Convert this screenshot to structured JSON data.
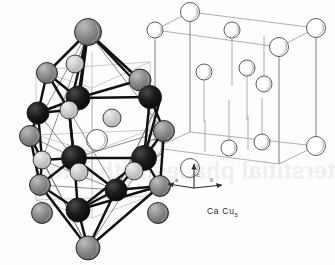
{
  "figure": {
    "name": "CaCu5 crystal structure figure",
    "compound_label": "Ca Cu",
    "compound_subscript": "5",
    "background_color": "#fdfdfd",
    "bleed_through_text": "terstitial phases with inter"
  },
  "axes": {
    "name": "crystallographic-axis-triad",
    "origin": [
      194,
      188
    ],
    "labels": {
      "a": "a",
      "b": "b",
      "c": "c"
    },
    "arrows": [
      {
        "axis": "a",
        "from": [
          194,
          188
        ],
        "to": [
          168,
          184
        ],
        "label_pos": [
          175,
          177
        ]
      },
      {
        "axis": "b",
        "from": [
          194,
          188
        ],
        "to": [
          222,
          185
        ],
        "label_pos": [
          210,
          177
        ]
      },
      {
        "axis": "c",
        "from": [
          194,
          188
        ],
        "to": [
          194,
          164
        ],
        "label_pos": [
          197,
          172
        ]
      }
    ]
  },
  "palette": {
    "sphere_black": "#141414",
    "sphere_dark_gray": "#5a5a5a",
    "sphere_mid_gray": "#8c8c8c",
    "sphere_light_gray": "#c6c6c6",
    "sphere_open": "#ffffff",
    "outline": "#2a2a2a",
    "cell_line": "#9a9a9a",
    "bond_heavy": "#111111",
    "bond_thin": "#6e6e6e"
  },
  "left_cluster": {
    "name": "coordination-polyhedron-cluster",
    "description": "Coordination polyhedron of shaded spheres joined by heavy bonds",
    "bonds_heavy": [
      [
        88,
        32,
        78,
        98
      ],
      [
        88,
        32,
        47,
        73
      ],
      [
        88,
        32,
        140,
        80
      ],
      [
        88,
        32,
        150,
        97
      ],
      [
        88,
        32,
        79,
        101
      ],
      [
        88,
        32,
        69,
        110
      ],
      [
        78,
        98,
        47,
        73
      ],
      [
        78,
        98,
        38,
        113
      ],
      [
        78,
        98,
        69,
        110
      ],
      [
        78,
        98,
        140,
        80
      ],
      [
        78,
        98,
        150,
        97
      ],
      [
        140,
        80,
        150,
        97
      ],
      [
        140,
        80,
        160,
        100
      ],
      [
        47,
        73,
        38,
        113
      ],
      [
        38,
        113,
        30,
        136
      ],
      [
        38,
        113,
        42,
        160
      ],
      [
        69,
        110,
        38,
        113
      ],
      [
        69,
        110,
        74,
        158
      ],
      [
        74,
        158,
        42,
        160
      ],
      [
        74,
        158,
        144,
        158
      ],
      [
        74,
        158,
        40,
        185
      ],
      [
        74,
        158,
        78,
        210
      ],
      [
        74,
        158,
        116,
        190
      ],
      [
        144,
        158,
        150,
        97
      ],
      [
        144,
        158,
        160,
        100
      ],
      [
        144,
        158,
        164,
        131
      ],
      [
        144,
        158,
        160,
        186
      ],
      [
        144,
        158,
        116,
        190
      ],
      [
        144,
        158,
        78,
        210
      ],
      [
        150,
        97,
        160,
        100
      ],
      [
        150,
        97,
        164,
        131
      ],
      [
        164,
        131,
        160,
        186
      ],
      [
        40,
        185,
        42,
        160
      ],
      [
        40,
        185,
        78,
        210
      ],
      [
        78,
        210,
        116,
        190
      ],
      [
        78,
        210,
        160,
        186
      ],
      [
        78,
        210,
        88,
        248
      ],
      [
        160,
        186,
        116,
        190
      ],
      [
        88,
        248,
        40,
        185
      ],
      [
        88,
        248,
        116,
        190
      ],
      [
        88,
        248,
        160,
        186
      ],
      [
        30,
        136,
        40,
        185
      ],
      [
        30,
        136,
        42,
        160
      ],
      [
        69,
        110,
        74,
        158
      ],
      [
        47,
        73,
        69,
        110
      ]
    ],
    "bonds_thin": [
      [
        88,
        32,
        30,
        136
      ],
      [
        88,
        32,
        164,
        131
      ],
      [
        88,
        32,
        42,
        160
      ],
      [
        30,
        136,
        74,
        158
      ],
      [
        164,
        131,
        74,
        158
      ],
      [
        42,
        160,
        116,
        190
      ],
      [
        40,
        185,
        116,
        190
      ],
      [
        88,
        248,
        30,
        136
      ],
      [
        88,
        248,
        164,
        131
      ],
      [
        47,
        73,
        88,
        32
      ],
      [
        38,
        113,
        74,
        158
      ],
      [
        160,
        100,
        116,
        190
      ],
      [
        69,
        110,
        116,
        190
      ],
      [
        88,
        248,
        42,
        160
      ],
      [
        88,
        248,
        160,
        100
      ]
    ],
    "spheres": [
      {
        "name": "sphere-apex-top",
        "cx": 88,
        "cy": 32,
        "r": 13.5,
        "shade": "mid"
      },
      {
        "name": "sphere-upper-left",
        "cx": 47,
        "cy": 73,
        "r": 10.5,
        "shade": "mid"
      },
      {
        "name": "sphere-upper-right",
        "cx": 140,
        "cy": 80,
        "r": 11.0,
        "shade": "mid"
      },
      {
        "name": "sphere-hub-upper-left",
        "cx": 38,
        "cy": 113,
        "r": 11.0,
        "shade": "black"
      },
      {
        "name": "sphere-hub-center-top",
        "cx": 78,
        "cy": 98,
        "r": 12.0,
        "shade": "black"
      },
      {
        "name": "sphere-hub-upper-right",
        "cx": 150,
        "cy": 97,
        "r": 11.5,
        "shade": "black"
      },
      {
        "name": "sphere-interstitial-upper-left",
        "cx": 69,
        "cy": 110,
        "r": 9.0,
        "shade": "light"
      },
      {
        "name": "sphere-interstitial-upper-right",
        "cx": 112,
        "cy": 118,
        "r": 9.0,
        "shade": "light"
      },
      {
        "name": "sphere-interstitial-top",
        "cx": 75,
        "cy": 64,
        "r": 9.0,
        "shade": "light"
      },
      {
        "name": "sphere-mid-left",
        "cx": 30,
        "cy": 136,
        "r": 10.5,
        "shade": "mid"
      },
      {
        "name": "sphere-mid-right",
        "cx": 164,
        "cy": 131,
        "r": 10.5,
        "shade": "mid"
      },
      {
        "name": "sphere-hub-center-left",
        "cx": 74,
        "cy": 158,
        "r": 12.5,
        "shade": "black"
      },
      {
        "name": "sphere-hub-center-right",
        "cx": 144,
        "cy": 158,
        "r": 12.5,
        "shade": "black"
      },
      {
        "name": "sphere-interstitial-mid-left",
        "cx": 42,
        "cy": 160,
        "r": 9.0,
        "shade": "light"
      },
      {
        "name": "sphere-interstitial-mid-center",
        "cx": 79,
        "cy": 172,
        "r": 9.0,
        "shade": "light"
      },
      {
        "name": "sphere-interstitial-mid-right",
        "cx": 134,
        "cy": 171,
        "r": 9.0,
        "shade": "light"
      },
      {
        "name": "sphere-lower-left",
        "cx": 40,
        "cy": 185,
        "r": 10.5,
        "shade": "mid"
      },
      {
        "name": "sphere-lower-right",
        "cx": 160,
        "cy": 186,
        "r": 10.5,
        "shade": "mid"
      },
      {
        "name": "sphere-hub-bottom",
        "cx": 116,
        "cy": 190,
        "r": 11.0,
        "shade": "black"
      },
      {
        "name": "sphere-hub-bottom-left",
        "cx": 78,
        "cy": 210,
        "r": 12.0,
        "shade": "black"
      },
      {
        "name": "sphere-bottom-left-edge",
        "cx": 42,
        "cy": 213,
        "r": 10.5,
        "shade": "mid"
      },
      {
        "name": "sphere-bottom-right-edge",
        "cx": 158,
        "cy": 213,
        "r": 10.5,
        "shade": "mid"
      },
      {
        "name": "sphere-apex-bottom",
        "cx": 88,
        "cy": 248,
        "r": 12.0,
        "shade": "mid"
      }
    ],
    "guide_lines": [
      [
        36,
        70,
        36,
        200
      ],
      [
        150,
        62,
        150,
        196
      ],
      [
        92,
        52,
        92,
        182
      ],
      [
        36,
        70,
        150,
        62
      ],
      [
        36,
        70,
        92,
        88
      ],
      [
        92,
        88,
        150,
        62
      ],
      [
        36,
        200,
        150,
        196
      ],
      [
        36,
        200,
        92,
        218
      ],
      [
        92,
        218,
        150,
        196
      ],
      [
        92,
        88,
        92,
        218
      ],
      [
        36,
        135,
        150,
        130
      ],
      [
        36,
        135,
        92,
        152
      ],
      [
        92,
        152,
        150,
        130
      ]
    ],
    "open_circles": [
      {
        "name": "open-circle-cluster-center",
        "cx": 97,
        "cy": 140,
        "r": 10.5
      }
    ]
  },
  "right_cell": {
    "name": "hexagonal-unit-cell",
    "description": "Outline unit cell with open circles on vertical stems",
    "cell_lines": [
      [
        155,
        30,
        190,
        12
      ],
      [
        190,
        12,
        316,
        28
      ],
      [
        316,
        28,
        279,
        47
      ],
      [
        279,
        47,
        155,
        30
      ],
      [
        155,
        148,
        190,
        132
      ],
      [
        190,
        132,
        316,
        146
      ],
      [
        316,
        146,
        279,
        164
      ],
      [
        279,
        164,
        155,
        148
      ],
      [
        155,
        30,
        155,
        148
      ],
      [
        190,
        12,
        190,
        132
      ],
      [
        316,
        28,
        316,
        146
      ],
      [
        279,
        47,
        279,
        164
      ]
    ],
    "stems": [
      [
        190,
        22,
        190,
        132
      ],
      [
        279,
        56,
        279,
        164
      ],
      [
        155,
        40,
        155,
        148
      ],
      [
        316,
        38,
        316,
        146
      ],
      [
        232,
        38,
        232,
        86
      ],
      [
        264,
        36,
        264,
        84
      ],
      [
        204,
        76,
        204,
        122
      ],
      [
        247,
        72,
        247,
        120
      ],
      [
        229,
        100,
        229,
        148
      ],
      [
        262,
        98,
        262,
        142
      ],
      [
        205,
        120,
        205,
        152
      ],
      [
        248,
        116,
        248,
        150
      ]
    ],
    "open_circles": [
      {
        "name": "cell-circle-top-front",
        "cx": 190,
        "cy": 12,
        "r": 9.5
      },
      {
        "name": "cell-circle-top-back-left",
        "cx": 155,
        "cy": 30,
        "r": 8.0
      },
      {
        "name": "cell-circle-top-mid",
        "cx": 232,
        "cy": 30,
        "r": 8.0
      },
      {
        "name": "cell-circle-top-right",
        "cx": 316,
        "cy": 28,
        "r": 9.5
      },
      {
        "name": "cell-circle-top-inner",
        "cx": 279,
        "cy": 47,
        "r": 9.5
      },
      {
        "name": "cell-circle-mid-left",
        "cx": 204,
        "cy": 72,
        "r": 8.0
      },
      {
        "name": "cell-circle-mid-center",
        "cx": 247,
        "cy": 68,
        "r": 8.0
      },
      {
        "name": "cell-circle-mid-right",
        "cx": 264,
        "cy": 84,
        "r": 8.0
      },
      {
        "name": "cell-circle-bottom-back-left",
        "cx": 155,
        "cy": 148,
        "r": 8.5
      },
      {
        "name": "cell-circle-bottom-inner",
        "cx": 229,
        "cy": 148,
        "r": 8.0
      },
      {
        "name": "cell-circle-bottom-front",
        "cx": 190,
        "cy": 168,
        "r": 9.5
      },
      {
        "name": "cell-circle-bottom-right",
        "cx": 316,
        "cy": 146,
        "r": 9.5
      },
      {
        "name": "cell-circle-bottom-mid",
        "cx": 262,
        "cy": 142,
        "r": 8.0
      }
    ]
  }
}
